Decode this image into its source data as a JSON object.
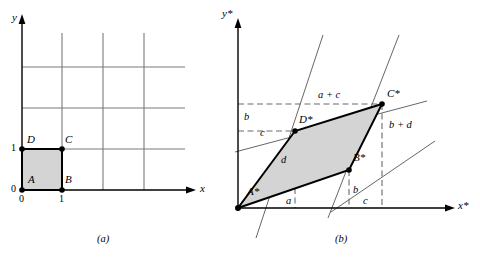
{
  "figure": {
    "captions": {
      "panel_a": "(a)",
      "panel_b": "(b)"
    }
  },
  "panel_a": {
    "axes": {
      "x_label": "x",
      "y_label": "y"
    },
    "ticks": {
      "origin": "0",
      "x_zero": "0",
      "x_one": "1",
      "y_zero": "0",
      "y_one": "1"
    },
    "vertices": [
      {
        "name": "A",
        "label": "A",
        "x": 0,
        "y": 0
      },
      {
        "name": "B",
        "label": "B",
        "x": 1,
        "y": 0
      },
      {
        "name": "C",
        "label": "C",
        "x": 1,
        "y": 1
      },
      {
        "name": "D",
        "label": "D",
        "x": 0,
        "y": 1
      }
    ],
    "grid": {
      "x_lines": [
        1,
        2,
        3
      ],
      "y_lines": [
        1,
        2,
        3
      ],
      "visible": true
    },
    "shape": {
      "name": "unit-square",
      "fill": "#d4d4d4",
      "stroke": "#000000"
    }
  },
  "panel_b": {
    "axes": {
      "x_label": "x*",
      "y_label": "y*"
    },
    "vertices": [
      {
        "name": "A-star",
        "label": "A*",
        "coords": "(0, 0)"
      },
      {
        "name": "B-star",
        "label": "B*",
        "coords": "(a, b)"
      },
      {
        "name": "C-star",
        "label": "C*",
        "coords": "(a + c, b + d)"
      },
      {
        "name": "D-star",
        "label": "D*",
        "coords": "(c, d)"
      }
    ],
    "dimension_labels": [
      {
        "name": "a-bottom",
        "text": "a",
        "meaning": "x-component of A*B*"
      },
      {
        "name": "b-bottom",
        "text": "b",
        "meaning": "y-component of A*B* shown at B*"
      },
      {
        "name": "c-bottom",
        "text": "c",
        "meaning": "x-component of B*C*"
      },
      {
        "name": "b-left",
        "text": "b",
        "meaning": "vertical gap above c on y* axis"
      },
      {
        "name": "c-left",
        "text": "c",
        "meaning": "height of D* marker on y* axis"
      },
      {
        "name": "d-interior",
        "text": "d",
        "meaning": "y-component of A*D*"
      },
      {
        "name": "a-plus-c-top",
        "text": "a + c",
        "meaning": "x-coordinate of C*"
      },
      {
        "name": "b-plus-d",
        "text": "b + d",
        "meaning": "y-coordinate of C*"
      }
    ],
    "shape": {
      "name": "image-parallelogram",
      "fill": "#d4d4d4",
      "stroke": "#000000"
    },
    "guide_lines": {
      "dashed_color": "#666666",
      "thin_color": "#555555",
      "description": "dashed projection lines to axes and thin extension lines through the parallelogram edges"
    }
  },
  "colors": {
    "shape_fill": "#d4d4d4",
    "shape_stroke": "#000000",
    "grid_line": "#7a7a7a",
    "axis": "#000000",
    "dashed_guide": "#6b6b6b"
  }
}
